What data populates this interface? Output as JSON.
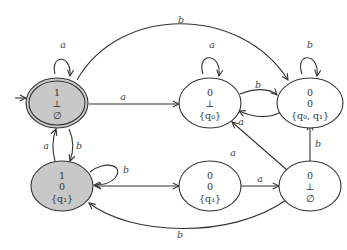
{
  "diagram": {
    "type": "state-machine",
    "colors": {
      "accepting_fill": "#c8c8c8",
      "normal_fill": "#ffffff",
      "stroke": "#333333"
    },
    "nodes": [
      {
        "id": "n1",
        "lines": [
          "1",
          "⊥",
          "∅"
        ],
        "initial": true,
        "double": true,
        "shaded": true
      },
      {
        "id": "n2",
        "lines": [
          "0",
          "⊥",
          "{q₀}"
        ],
        "shaded": false
      },
      {
        "id": "n3",
        "lines": [
          "0",
          "0",
          "{q₀, q₁}"
        ],
        "shaded": false
      },
      {
        "id": "n4",
        "lines": [
          "1",
          "0",
          "{q₁}"
        ],
        "shaded": true
      },
      {
        "id": "n5",
        "lines": [
          "0",
          "0",
          "{q₁}"
        ],
        "shaded": false
      },
      {
        "id": "n6",
        "lines": [
          "0",
          "⊥",
          "∅"
        ],
        "shaded": false
      }
    ],
    "edges": [
      {
        "from": "n1",
        "to": "n1",
        "label": "a"
      },
      {
        "from": "n1",
        "to": "n2",
        "label": "a"
      },
      {
        "from": "n1",
        "to": "n3",
        "label": "b"
      },
      {
        "from": "n1",
        "to": "n4",
        "label": "b"
      },
      {
        "from": "n4",
        "to": "n1",
        "label": "a"
      },
      {
        "from": "n2",
        "to": "n2",
        "label": "a"
      },
      {
        "from": "n2",
        "to": "n3",
        "label": "b"
      },
      {
        "from": "n3",
        "to": "n2",
        "label": "a"
      },
      {
        "from": "n3",
        "to": "n3",
        "label": "b"
      },
      {
        "from": "n4",
        "to": "n4",
        "label": "b"
      },
      {
        "from": "n4",
        "to": "n5",
        "label": ""
      },
      {
        "from": "n5",
        "to": "n6",
        "label": "a"
      },
      {
        "from": "n6",
        "to": "n2",
        "label": "a"
      },
      {
        "from": "n6",
        "to": "n3",
        "label": "b"
      },
      {
        "from": "n6",
        "to": "n4",
        "label": "b"
      }
    ]
  }
}
